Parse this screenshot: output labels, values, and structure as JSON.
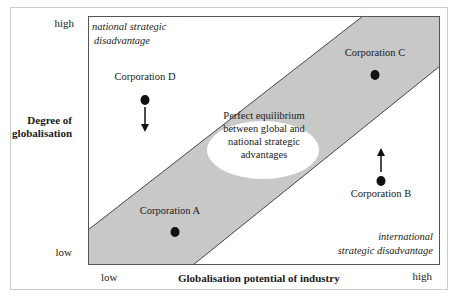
{
  "diagram": {
    "y_axis": {
      "title_line1": "Degree of",
      "title_line2": "globalisation",
      "high": "high",
      "low": "low"
    },
    "x_axis": {
      "title": "Globalisation potential of industry",
      "low": "low",
      "high": "high"
    },
    "regions": {
      "top_left_line1": "national strategic",
      "top_left_line2": "disadvantage",
      "bottom_right_line1": "international",
      "bottom_right_line2": "strategic disadvantage",
      "center_line1": "Perfect equilibrium",
      "center_line2": "between global and",
      "center_line3": "national strategic",
      "center_line4": "advantages"
    },
    "corporations": {
      "a": {
        "label": "Corporation A",
        "movement": "none"
      },
      "b": {
        "label": "Corporation B",
        "movement": "up"
      },
      "c": {
        "label": "Corporation C",
        "movement": "none"
      },
      "d": {
        "label": "Corporation D",
        "movement": "down"
      }
    },
    "colors": {
      "band": "#c8c8c8",
      "border": "#555555",
      "outer_border": "#cccccc",
      "dot": "#111111"
    }
  }
}
